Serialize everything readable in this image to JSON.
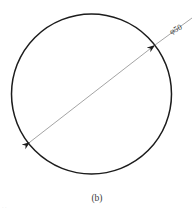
{
  "figure": {
    "caption": "(b)",
    "background_color": "#ffffff",
    "width": 194,
    "height": 213,
    "corner_artifact": "· ·"
  },
  "shape": {
    "type": "circle",
    "center_x": 91.5,
    "center_y": 94,
    "radius": 80,
    "stroke_color": "#1c1c1c",
    "stroke_width": 1.5,
    "fill": "none"
  },
  "dimension": {
    "label": "φ50",
    "label_symbol": "φ",
    "label_value": "50",
    "label_color": "#2b2b2b",
    "label_rotation_deg": -27,
    "label_x": 176,
    "label_y": 30,
    "line_color": "#7d7d7d",
    "line_width": 0.7,
    "angle_deg": -27,
    "start_x": 30,
    "start_y": 142,
    "end_x": 155,
    "end_y": 45,
    "leader_end_x": 192,
    "leader_end_y": 18,
    "arrow_color": "#1c1c1c",
    "arrow_length": 7,
    "arrow_width": 2.6
  },
  "chart_data": {
    "type": "diagram",
    "title": "(b)",
    "elements": [
      {
        "kind": "circle",
        "cx": 91.5,
        "cy": 94,
        "r": 80
      },
      {
        "kind": "dimension-line",
        "from": [
          30,
          142
        ],
        "to": [
          155,
          45
        ],
        "label": "φ50",
        "arrows": "both"
      }
    ]
  }
}
